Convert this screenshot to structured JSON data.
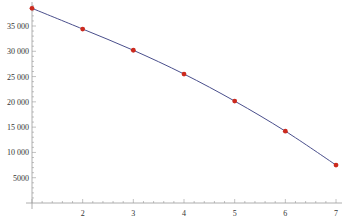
{
  "chart_data": {
    "type": "line",
    "title": "",
    "xlabel": "",
    "ylabel": "",
    "x": [
      1,
      2,
      3,
      4,
      5,
      6,
      7
    ],
    "series": [
      {
        "name": "data",
        "values": [
          38500,
          34400,
          30200,
          25500,
          20150,
          14200,
          7500
        ],
        "markers": true,
        "line": "smooth fit"
      }
    ],
    "xlim": [
      1,
      7
    ],
    "ylim": [
      0,
      40000
    ],
    "x_ticks": [
      2,
      3,
      4,
      5,
      6,
      7
    ],
    "y_ticks": [
      5000,
      10000,
      15000,
      20000,
      25000,
      30000,
      35000
    ],
    "x_tick_labels": [
      "2",
      "3",
      "4",
      "5",
      "6",
      "7"
    ],
    "y_tick_labels": [
      "5000",
      "10 000",
      "15 000",
      "20 000",
      "25 000",
      "30 000",
      "35 000"
    ],
    "grid": false,
    "legend": "none"
  },
  "colors": {
    "line": "#4a4f8c",
    "marker": "#cc2a1e",
    "axis": "#999999",
    "text": "#333333"
  }
}
